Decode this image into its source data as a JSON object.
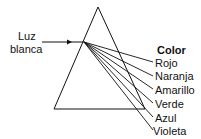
{
  "input_label": {
    "line1": "Luz",
    "line2": "blanca"
  },
  "legend": {
    "title": "Color",
    "colors": [
      "Rojo",
      "Naranja",
      "Amarillo",
      "Verde",
      "Azul",
      "Violeta"
    ]
  }
}
